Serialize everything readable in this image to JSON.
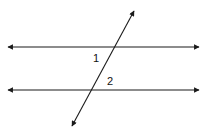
{
  "diagram": {
    "stroke_color": "#1a1a1a",
    "background": "#ffffff",
    "lines": [
      {
        "name": "top-parallel-line",
        "x1": 8,
        "y1": 47,
        "x2": 199,
        "y2": 47,
        "arrows": "both"
      },
      {
        "name": "bottom-parallel-line",
        "x1": 8,
        "y1": 90,
        "x2": 199,
        "y2": 90,
        "arrows": "both"
      },
      {
        "name": "transversal",
        "x1": 134,
        "y1": 11,
        "x2": 72,
        "y2": 126,
        "arrows": "both"
      }
    ],
    "angle_labels": [
      {
        "name": "angle-1",
        "text": "1",
        "x": 93,
        "y": 62
      },
      {
        "name": "angle-2",
        "text": "2",
        "x": 107,
        "y": 85
      }
    ]
  }
}
